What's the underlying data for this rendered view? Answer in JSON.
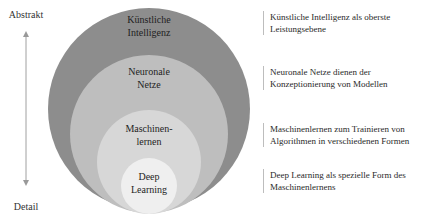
{
  "axis": {
    "top_label": "Abstrakt",
    "bottom_label": "Detail",
    "arrow": "double-headed-vertical-arrow"
  },
  "circles": [
    {
      "line1": "Künstliche",
      "line2": "Intelligenz",
      "color": "#8d8d8d"
    },
    {
      "line1": "Neuronale",
      "line2": "Netze",
      "color": "#bebebe"
    },
    {
      "line1": "Maschinen-",
      "line2": "lernen",
      "color": "#d7d7d7"
    },
    {
      "line1": "Deep",
      "line2": "Learning",
      "color": "#efefef"
    }
  ],
  "descriptions": [
    {
      "line1": "Künstliche Intelligenz als oberste",
      "line2": "Leistungsebene"
    },
    {
      "line1": "Neuronale Netze dienen der",
      "line2": "Konzeptionierung von Modellen"
    },
    {
      "line1": "Maschinenlernen zum Trainieren von",
      "line2": "Algorithmen in verschiedenen Formen"
    },
    {
      "line1": "Deep Learning als spezielle Form des",
      "line2": "Maschinenlernens"
    }
  ]
}
